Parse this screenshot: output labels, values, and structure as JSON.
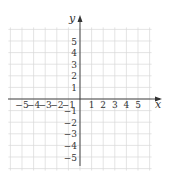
{
  "chart_data": {
    "type": "scatter",
    "title": "",
    "xlabel": "x",
    "ylabel": "y",
    "xlim": [
      -6,
      6
    ],
    "ylim": [
      -6,
      6
    ],
    "grid": true,
    "x_ticks": [
      "-5",
      "-4",
      "-3",
      "-2",
      "-1",
      "1",
      "2",
      "3",
      "4",
      "5"
    ],
    "y_ticks": [
      "5",
      "4",
      "3",
      "2",
      "1",
      "-1",
      "-2",
      "-3",
      "-4",
      "-5"
    ],
    "series": []
  },
  "colors": {
    "grid": "#d8d8d8",
    "axis": "#333333",
    "text": "#333333"
  }
}
